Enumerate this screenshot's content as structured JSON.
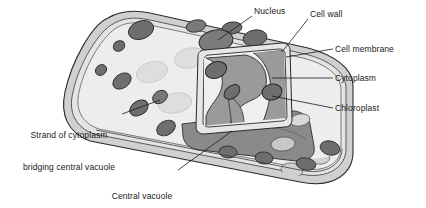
{
  "diagram": {
    "background_color": "#ffffff",
    "ink_color": "#1a1a1a",
    "palette": {
      "cell_wall_fill": "#d8d8d8",
      "top_surface_fill": "#ececec",
      "cytoplasm_fill": "#9a9a9a",
      "vacuole_fill": "#8a8a8a",
      "chloroplast_fill": "#6e6e6e",
      "ghost_chloroplast_fill": "#dcdcdc",
      "outline": "#2a2a2a"
    },
    "labels": [
      {
        "id": "nucleus",
        "name": "Nucleus",
        "lines": [
          "Nucleus"
        ],
        "x": 254,
        "y": 6,
        "align": "left",
        "leader": {
          "from_x": 252,
          "from_y": 16,
          "to_x": 218,
          "to_y": 40
        }
      },
      {
        "id": "cell-wall",
        "name": "Cell wall",
        "lines": [
          "Cell wall"
        ],
        "x": 310,
        "y": 9,
        "align": "left",
        "leader": {
          "from_x": 308,
          "from_y": 19,
          "to_x": 282,
          "to_y": 52
        }
      },
      {
        "id": "cell-membrane",
        "name": "Cell membrane",
        "lines": [
          "Cell membrane"
        ],
        "x": 335,
        "y": 44,
        "align": "left",
        "leader": {
          "from_x": 333,
          "from_y": 49,
          "to_x": 286,
          "to_y": 57
        }
      },
      {
        "id": "cytoplasm",
        "name": "Cytoplasm",
        "lines": [
          "Cytoplasm"
        ],
        "x": 335,
        "y": 73,
        "align": "left",
        "leader": {
          "from_x": 333,
          "from_y": 78,
          "to_x": 272,
          "to_y": 78
        }
      },
      {
        "id": "chloroplast",
        "name": "Chloroplast",
        "lines": [
          "Chloroplast"
        ],
        "x": 335,
        "y": 103,
        "align": "left",
        "leader": {
          "from_x": 333,
          "from_y": 108,
          "to_x": 272,
          "to_y": 96
        }
      },
      {
        "id": "strand-of-cytoplasm",
        "name": "Strand of cytoplasm bridging central vacuole",
        "lines": [
          "Strand of cytoplasm",
          "bridging central vacuole"
        ],
        "x": 16,
        "y": 109,
        "align": "left",
        "leader": {
          "from_x": 122,
          "from_y": 114,
          "to_x": 160,
          "to_y": 100
        }
      },
      {
        "id": "central-vacuole",
        "name": "Central vacuole (fluid-filled)",
        "lines": [
          "Central vacuole",
          "(fluid-filled)"
        ],
        "x": 106,
        "y": 170,
        "align": "center",
        "leader": {
          "from_x": 178,
          "from_y": 170,
          "to_x": 232,
          "to_y": 131
        }
      }
    ],
    "structures": [
      {
        "id": "cell-wall-body",
        "name": "cell wall"
      },
      {
        "id": "top-surface",
        "name": "top surface of cell"
      },
      {
        "id": "cut-face-panel",
        "name": "cut face panel"
      },
      {
        "id": "cytoplasm-region",
        "name": "cytoplasm"
      },
      {
        "id": "central-vacuole-floor",
        "name": "central vacuole"
      },
      {
        "id": "nucleus-body",
        "name": "nucleus"
      },
      {
        "id": "chloroplast-group",
        "name": "chloroplasts"
      }
    ]
  }
}
